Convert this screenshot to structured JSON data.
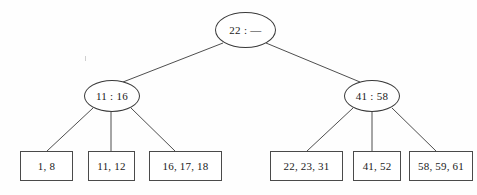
{
  "diagram": {
    "background_color": "#fefefe",
    "stroke_color": "#3a3a3a",
    "text_color": "#1a1a1a",
    "root": {
      "label": "22 : —",
      "name": "root-node"
    },
    "internal_nodes": [
      {
        "label": "11 : 16",
        "name": "internal-node-left"
      },
      {
        "label": "41 : 58",
        "name": "internal-node-right"
      }
    ],
    "leaves": [
      {
        "label": "1, 8",
        "name": "leaf-box-1"
      },
      {
        "label": "11, 12",
        "name": "leaf-box-2"
      },
      {
        "label": "16, 17, 18",
        "name": "leaf-box-3"
      },
      {
        "label": "22, 23, 31",
        "name": "leaf-box-4"
      },
      {
        "label": "41, 52",
        "name": "leaf-box-5"
      },
      {
        "label": "58, 59, 61",
        "name": "leaf-box-6"
      }
    ]
  }
}
